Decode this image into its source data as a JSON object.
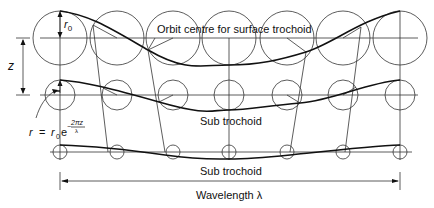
{
  "labels": {
    "surface_trochoid": "Orbit centre for surface trochoid",
    "sub_trochoid_1": "Sub trochoid",
    "sub_trochoid_2": "Sub trochoid",
    "wavelength": "Wavelength λ",
    "r0": "r",
    "r0_sub": "0",
    "z": "z",
    "formula_r": "r",
    "formula_eq": "=",
    "formula_r0": "r",
    "formula_r0_sub": "0",
    "formula_e": "e",
    "formula_exp_num": "2πz",
    "formula_exp_den": "λ",
    "formula_minus": "−"
  },
  "geometry": {
    "centers_x": [
      60,
      117,
      173,
      229,
      287,
      343,
      400
    ],
    "rows": [
      {
        "y": 38,
        "r": 27
      },
      {
        "y": 95,
        "r": 15
      },
      {
        "y": 152,
        "r": 7
      }
    ]
  }
}
